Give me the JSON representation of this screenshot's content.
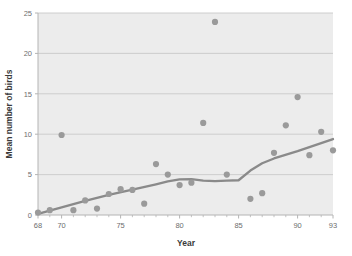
{
  "chart_data": {
    "type": "scatter",
    "title": "",
    "xlabel": "Year",
    "ylabel": "Mean number of birds",
    "xlim": [
      68,
      93
    ],
    "ylim": [
      0,
      25
    ],
    "xticks": [
      68,
      70,
      75,
      80,
      85,
      90,
      93
    ],
    "yticks": [
      0,
      5,
      10,
      15,
      20,
      25
    ],
    "xtick_labels": [
      "68",
      "70",
      "75",
      "80",
      "85",
      "90",
      "93"
    ],
    "ytick_labels": [
      "0",
      "5",
      "10",
      "15",
      "20",
      "25"
    ],
    "grid": "horizontal",
    "legend": "none",
    "plot_background": "#ececec",
    "marker_color": "#9a9a9a",
    "line_color": "#8a8a8a",
    "axis_color": "#b4b4b4",
    "gridline_color": "#c9c9c9",
    "series": [
      {
        "name": "Mean number of birds",
        "marker": "circle",
        "points": [
          {
            "x": 68,
            "y": 0.3
          },
          {
            "x": 69,
            "y": 0.6
          },
          {
            "x": 70,
            "y": 9.9
          },
          {
            "x": 71,
            "y": 0.6
          },
          {
            "x": 72,
            "y": 1.8
          },
          {
            "x": 73,
            "y": 0.8
          },
          {
            "x": 74,
            "y": 2.6
          },
          {
            "x": 75,
            "y": 3.2
          },
          {
            "x": 76,
            "y": 3.1
          },
          {
            "x": 77,
            "y": 1.4
          },
          {
            "x": 78,
            "y": 6.3
          },
          {
            "x": 79,
            "y": 5.0
          },
          {
            "x": 80,
            "y": 3.7
          },
          {
            "x": 81,
            "y": 4.0
          },
          {
            "x": 82,
            "y": 11.4
          },
          {
            "x": 83,
            "y": 23.9
          },
          {
            "x": 84,
            "y": 5.0
          },
          {
            "x": 86,
            "y": 2.0
          },
          {
            "x": 87,
            "y": 2.7
          },
          {
            "x": 88,
            "y": 7.7
          },
          {
            "x": 89,
            "y": 11.1
          },
          {
            "x": 90,
            "y": 14.6
          },
          {
            "x": 91,
            "y": 7.4
          },
          {
            "x": 92,
            "y": 10.3
          },
          {
            "x": 93,
            "y": 8.0
          }
        ]
      }
    ],
    "trend_line": {
      "name": "smoothed trend",
      "points": [
        {
          "x": 68,
          "y": 0.15
        },
        {
          "x": 70,
          "y": 0.95
        },
        {
          "x": 72,
          "y": 1.75
        },
        {
          "x": 74,
          "y": 2.5
        },
        {
          "x": 76,
          "y": 3.15
        },
        {
          "x": 78,
          "y": 3.8
        },
        {
          "x": 79,
          "y": 4.15
        },
        {
          "x": 80,
          "y": 4.4
        },
        {
          "x": 81,
          "y": 4.45
        },
        {
          "x": 82,
          "y": 4.25
        },
        {
          "x": 83,
          "y": 4.2
        },
        {
          "x": 84,
          "y": 4.25
        },
        {
          "x": 85,
          "y": 4.3
        },
        {
          "x": 86,
          "y": 5.5
        },
        {
          "x": 87,
          "y": 6.4
        },
        {
          "x": 88,
          "y": 7.0
        },
        {
          "x": 90,
          "y": 7.9
        },
        {
          "x": 93,
          "y": 9.4
        }
      ]
    }
  }
}
